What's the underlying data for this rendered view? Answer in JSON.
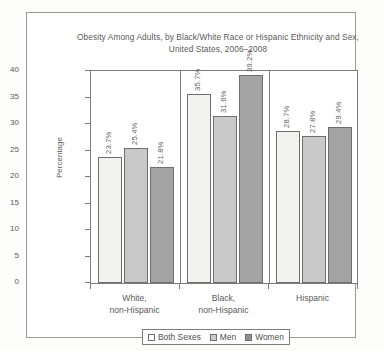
{
  "chart_data": {
    "type": "bar",
    "title": "Obesity Among Adults, by Black/White Race or Hispanic Ethnicity and Sex, United States, 2006–2008",
    "title_line1": "Obesity Among Adults, by Black/White Race or Hispanic Ethnicity and Sex,",
    "title_line2": "United States, 2006–2008",
    "xlabel": "",
    "ylabel": "Percentage",
    "ylim": [
      0,
      40
    ],
    "yticks": [
      "0",
      "5",
      "10",
      "15",
      "20",
      "25",
      "30",
      "35",
      "40"
    ],
    "grid": false,
    "legend_position": "bottom",
    "categories": [
      "White, non-Hispanic",
      "Black, non-Hispanic",
      "Hispanic"
    ],
    "category_lines": [
      [
        "White,",
        "non-Hispanic"
      ],
      [
        "Black,",
        "non-Hispanic"
      ],
      [
        "Hispanic",
        ""
      ]
    ],
    "series": [
      {
        "name": "Both Sexes",
        "color": "#f2f2ef",
        "values": [
          23.7,
          35.7,
          28.7
        ],
        "labels": [
          "23.7%",
          "35.7%",
          "28.7%"
        ]
      },
      {
        "name": "Men",
        "color": "#c9c9c9",
        "values": [
          25.4,
          31.6,
          27.8
        ],
        "labels": [
          "25.4%",
          "31.6%",
          "27.8%"
        ]
      },
      {
        "name": "Women",
        "color": "#a3a3a3",
        "values": [
          21.8,
          39.2,
          29.4
        ],
        "labels": [
          "21.8%",
          "39.2%",
          "29.4%"
        ]
      }
    ]
  }
}
